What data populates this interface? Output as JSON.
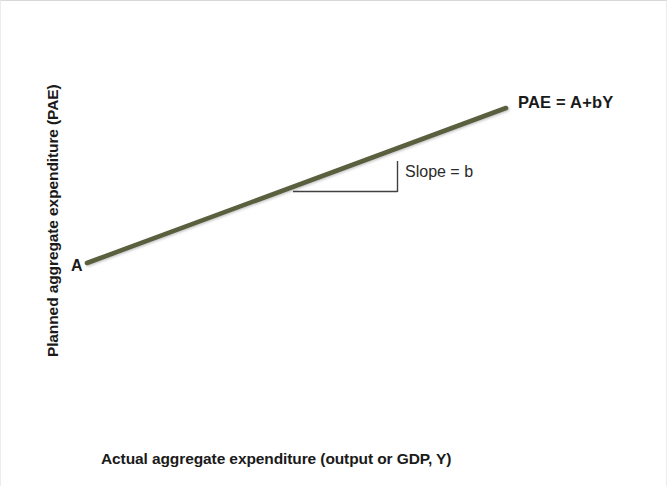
{
  "chart_data": {
    "type": "line",
    "title": "",
    "xlabel": "Actual aggregate expenditure (output or GDP, Y)",
    "ylabel": "Planned aggregate expenditure (PAE)",
    "grid": false,
    "legend": "none",
    "axis_ticks": [],
    "series": [
      {
        "name": "PAE = A+bY",
        "color": "#5a5f3e",
        "line_width": 4,
        "points": [
          {
            "x_px": 86,
            "y_px": 262,
            "note": "vertical intercept A"
          },
          {
            "x_px": 505,
            "y_px": 107,
            "note": "upper right end of PAE line"
          }
        ]
      }
    ],
    "annotations": [
      {
        "name": "intercept-label",
        "text": "A",
        "bold": true,
        "x_px": 70,
        "y_px": 257
      },
      {
        "name": "line-equation-label",
        "text": "PAE = A+bY",
        "bold": true,
        "x_px": 517,
        "y_px": 93
      },
      {
        "name": "slope-label",
        "text": "Slope = b",
        "bold": false,
        "x_px": 404,
        "y_px": 163
      },
      {
        "name": "slope-triangle",
        "shape": "right-triangle",
        "run_start_px": {
          "x": 292,
          "y": 190
        },
        "run_end_px": {
          "x": 396,
          "y": 190
        },
        "rise_start_px": {
          "x": 396,
          "y": 190
        },
        "rise_end_px": {
          "x": 396,
          "y": 160
        },
        "color": "#404040"
      }
    ],
    "axes": {
      "color": "#555555",
      "y_axis": {
        "x_px": 86,
        "y_top_px": 17,
        "y_bottom_px": 437
      },
      "x_axis": {
        "y_px": 437,
        "x_left_px": 86,
        "x_right_px": 520
      }
    }
  },
  "figure": {
    "axis_label_y": "Planned aggregate expenditure (PAE)",
    "axis_label_x": "Actual aggregate expenditure (output or GDP, Y)",
    "intercept_label": "A",
    "line_equation_label": "PAE = A+bY",
    "slope_label": "Slope = b",
    "line_color": "#5a5f3e",
    "axis_color": "#555555",
    "annotation_color": "#404040",
    "background_color": "#ffffff"
  }
}
